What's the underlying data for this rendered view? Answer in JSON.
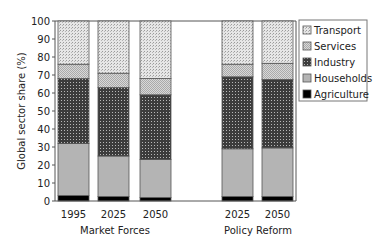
{
  "chart_data": {
    "type": "bar",
    "stacked": true,
    "title": "",
    "xlabel": "",
    "ylabel": "Global sector share (%)",
    "ylim": [
      0,
      100
    ],
    "yticks": [
      0,
      10,
      20,
      30,
      40,
      50,
      60,
      70,
      80,
      90,
      100
    ],
    "groups": [
      {
        "label": "Market Forces",
        "categories": [
          "1995",
          "2025",
          "2050"
        ]
      },
      {
        "label": "Policy Reform",
        "categories": [
          "2025",
          "2050"
        ]
      }
    ],
    "categories": [
      "1995",
      "2025",
      "2050",
      "2025",
      "2050"
    ],
    "series": [
      {
        "name": "Agriculture",
        "values": [
          3,
          2.5,
          2,
          2.5,
          2.5
        ]
      },
      {
        "name": "Households",
        "values": [
          29,
          22.5,
          21,
          26.5,
          27
        ]
      },
      {
        "name": "Industry",
        "values": [
          36,
          38,
          36,
          40,
          38
        ]
      },
      {
        "name": "Services",
        "values": [
          8,
          8,
          9,
          7,
          9
        ]
      },
      {
        "name": "Transport",
        "values": [
          24,
          29,
          32,
          24,
          23.5
        ]
      }
    ],
    "legend": {
      "position": "right",
      "entries": [
        "Transport",
        "Services",
        "Industry",
        "Households",
        "Agriculture"
      ]
    },
    "grid": false
  },
  "colors": {
    "Agriculture": "#000000",
    "Households": "#b4b4b4",
    "Industry": "#4a4a4a",
    "Services": "#cfcfcf",
    "Transport": "#dedede",
    "border": "#555555"
  }
}
